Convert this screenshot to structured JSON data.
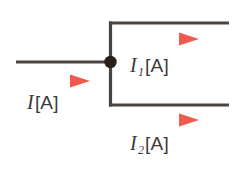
{
  "figure": {
    "background_color": "#ffffff",
    "wire_color": "#4a4440",
    "node_color": "#2b1f1a",
    "arrow_color": "#f2695c",
    "label_color": "#3c3a38"
  },
  "labels": {
    "input_current": {
      "symbol": "I",
      "subscript": "",
      "unit": "[A]",
      "full": "I[A]"
    },
    "branch1_current": {
      "symbol": "I",
      "subscript": "1",
      "unit": "[A]",
      "full": "I1[A]"
    },
    "branch2_current": {
      "symbol": "I",
      "subscript": "2",
      "unit": "[A]",
      "full": "I2[A]"
    }
  },
  "icons": {
    "junction_node": "filled-circle-node",
    "arrow_input": "right-arrow-icon",
    "arrow_branch1": "right-arrow-icon",
    "arrow_branch2": "right-arrow-icon"
  },
  "geometry": {
    "input_wire": {
      "x1": 16,
      "y1": 62,
      "x2": 110,
      "y2": 62
    },
    "vertical_wire": {
      "x1": 110,
      "y1": 23,
      "x2": 110,
      "y2": 105
    },
    "top_branch_wire": {
      "x1": 110,
      "y1": 23,
      "x2": 228,
      "y2": 23
    },
    "bottom_branch_wire": {
      "x1": 110,
      "y1": 105,
      "x2": 228,
      "y2": 105
    },
    "node": {
      "cx": 110,
      "cy": 62,
      "r": 6
    },
    "arrow_input": {
      "x1": 28,
      "y1": 81,
      "x2": 88,
      "y2": 81
    },
    "arrow_branch1": {
      "x1": 137,
      "y1": 39,
      "x2": 197,
      "y2": 39
    },
    "arrow_branch2": {
      "x1": 137,
      "y1": 120,
      "x2": 197,
      "y2": 120
    }
  }
}
